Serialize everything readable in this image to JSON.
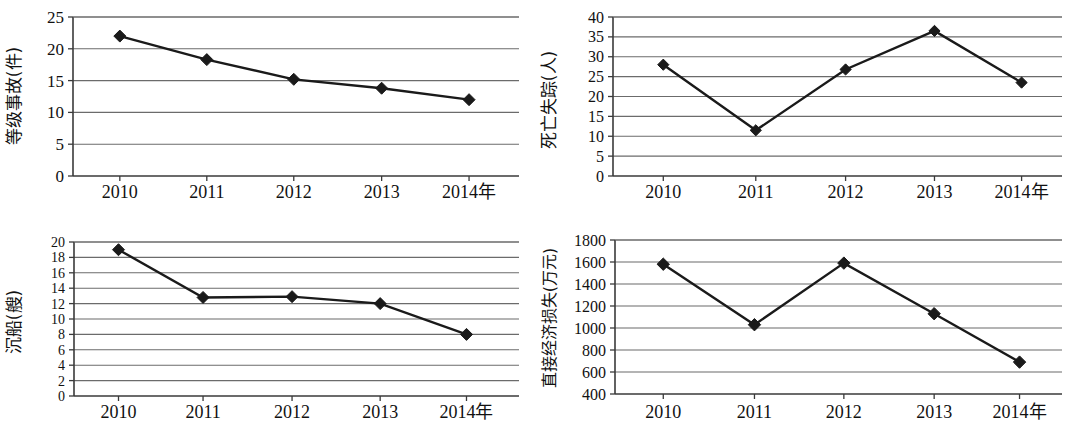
{
  "figure": {
    "background": "#ffffff",
    "line_color": "#1a1a1a",
    "grid_color": "#6b6b6b",
    "frame_color": "#3a3a3a",
    "marker": "diamond",
    "panel_count": 4
  },
  "chart_data": [
    {
      "type": "line",
      "id": "grade-accidents",
      "title": "",
      "xlabel": "",
      "ylabel": "等级事故(件)",
      "categories": [
        "2010",
        "2011",
        "2012",
        "2013",
        "2014年"
      ],
      "x": [
        2010,
        2011,
        2012,
        2013,
        2014
      ],
      "values": [
        22,
        18.3,
        15.2,
        13.8,
        12
      ],
      "ylim": [
        0,
        25
      ],
      "yticks": [
        0,
        5,
        10,
        15,
        20,
        25
      ],
      "ytick_labels": [
        "0",
        "5",
        "10",
        "15",
        "20",
        "25"
      ],
      "xtick_labels": [
        "2010",
        "2011",
        "2012",
        "2013",
        "2014年"
      ],
      "grid": true,
      "legend": "none",
      "marker": "diamond",
      "series": [
        {
          "name": "等级事故(件)",
          "values": [
            22,
            18.3,
            15.2,
            13.8,
            12
          ]
        }
      ]
    },
    {
      "type": "line",
      "id": "deaths-missing",
      "title": "",
      "xlabel": "",
      "ylabel": "死亡失踪(人)",
      "categories": [
        "2010",
        "2011",
        "2012",
        "2013",
        "2014年"
      ],
      "x": [
        2010,
        2011,
        2012,
        2013,
        2014
      ],
      "values": [
        28,
        11.5,
        26.8,
        36.5,
        23.5
      ],
      "ylim": [
        0,
        40
      ],
      "yticks": [
        0,
        5,
        10,
        15,
        20,
        25,
        30,
        35,
        40
      ],
      "ytick_labels": [
        "0",
        "5",
        "10",
        "15",
        "20",
        "25",
        "30",
        "35",
        "40"
      ],
      "xtick_labels": [
        "2010",
        "2011",
        "2012",
        "2013",
        "2014年"
      ],
      "grid": true,
      "legend": "none",
      "marker": "diamond",
      "series": [
        {
          "name": "死亡失踪(人)",
          "values": [
            28,
            11.5,
            26.8,
            36.5,
            23.5
          ]
        }
      ]
    },
    {
      "type": "line",
      "id": "sunken-vessels",
      "title": "",
      "xlabel": "",
      "ylabel": "沉船(艘)",
      "categories": [
        "2010",
        "2011",
        "2012",
        "2013",
        "2014年"
      ],
      "x": [
        2010,
        2011,
        2012,
        2013,
        2014
      ],
      "values": [
        19,
        12.8,
        12.9,
        12,
        8
      ],
      "ylim": [
        0,
        20
      ],
      "yticks": [
        0,
        2,
        4,
        6,
        8,
        10,
        12,
        14,
        16,
        18,
        20
      ],
      "ytick_labels": [
        "0",
        "2",
        "4",
        "6",
        "8",
        "10",
        "12",
        "14",
        "16",
        "18",
        "20"
      ],
      "xtick_labels": [
        "2010",
        "2011",
        "2012",
        "2013",
        "2014年"
      ],
      "grid": true,
      "legend": "none",
      "marker": "diamond",
      "series": [
        {
          "name": "沉船(艘)",
          "values": [
            19,
            12.8,
            12.9,
            12,
            8
          ]
        }
      ]
    },
    {
      "type": "line",
      "id": "direct-economic-loss",
      "title": "",
      "xlabel": "",
      "ylabel": "直接经济损失(万元)",
      "categories": [
        "2010",
        "2011",
        "2012",
        "2013",
        "2014年"
      ],
      "x": [
        2010,
        2011,
        2012,
        2013,
        2014
      ],
      "values": [
        1580,
        1030,
        1590,
        1130,
        690
      ],
      "ylim": [
        400,
        1800
      ],
      "yticks": [
        400,
        600,
        800,
        1000,
        1200,
        1400,
        1600,
        1800
      ],
      "ytick_labels": [
        "400",
        "600",
        "800",
        "1000",
        "1200",
        "1400",
        "1600",
        "1800"
      ],
      "xtick_labels": [
        "2010",
        "2011",
        "2012",
        "2013",
        "2014年"
      ],
      "grid": true,
      "legend": "none",
      "marker": "diamond",
      "series": [
        {
          "name": "直接经济损失(万元)",
          "values": [
            1580,
            1030,
            1590,
            1130,
            690
          ]
        }
      ]
    }
  ]
}
